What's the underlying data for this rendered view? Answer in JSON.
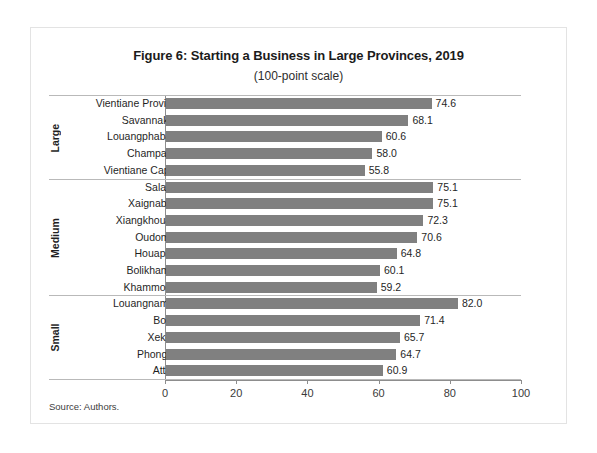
{
  "figure": {
    "title": "Figure 6: Starting a Business in Large Provinces, 2019",
    "subtitle": "(100-point scale)",
    "source_note": "Source: Authors."
  },
  "chart_data": {
    "type": "bar",
    "orientation": "horizontal",
    "title": "Figure 6: Starting a Business in Large Provinces, 2019",
    "subtitle": "(100-point scale)",
    "xlabel": "",
    "ylabel": "",
    "xlim": [
      0,
      100
    ],
    "xticks": [
      0,
      20,
      40,
      60,
      80,
      100
    ],
    "xtick_labels": [
      "0",
      "20",
      "40",
      "60",
      "80",
      "100"
    ],
    "grid": false,
    "legend": false,
    "bar_color": "#808080",
    "axis_color": "#8d8d8d",
    "categories": [
      "Vientiane Province",
      "Savannakhet",
      "Louangphabang",
      "Champasak",
      "Vientiane Capital",
      "Salavan",
      "Xaignabouli",
      "Xiangkhouang",
      "Oudomxai",
      "Houaphan",
      "Bolikhamxai",
      "Khammouan",
      "Louangnamtha",
      "Bokeo",
      "Xekong",
      "Phongsali",
      "Attapu"
    ],
    "values": [
      74.6,
      68.1,
      60.6,
      58.0,
      55.8,
      75.1,
      75.1,
      72.3,
      70.6,
      64.8,
      60.1,
      59.2,
      82.0,
      71.4,
      65.7,
      64.7,
      60.9
    ],
    "value_labels": [
      "74.6",
      "68.1",
      "60.6",
      "58.0",
      "55.8",
      "75.1",
      "75.1",
      "72.3",
      "70.6",
      "64.8",
      "60.1",
      "59.2",
      "82.0",
      "71.4",
      "65.7",
      "64.7",
      "60.9"
    ],
    "groups": [
      {
        "name": "Large",
        "categories": [
          "Vientiane Province",
          "Savannakhet",
          "Louangphabang",
          "Champasak",
          "Vientiane Capital"
        ],
        "values": [
          74.6,
          68.1,
          60.6,
          58.0,
          55.8
        ]
      },
      {
        "name": "Medium",
        "categories": [
          "Salavan",
          "Xaignabouli",
          "Xiangkhouang",
          "Oudomxai",
          "Houaphan",
          "Bolikhamxai",
          "Khammouan"
        ],
        "values": [
          75.1,
          75.1,
          72.3,
          70.6,
          64.8,
          60.1,
          59.2
        ]
      },
      {
        "name": "Small",
        "categories": [
          "Louangnamtha",
          "Bokeo",
          "Xekong",
          "Phongsali",
          "Attapu"
        ],
        "values": [
          82.0,
          71.4,
          65.7,
          64.7,
          60.9
        ]
      }
    ]
  }
}
